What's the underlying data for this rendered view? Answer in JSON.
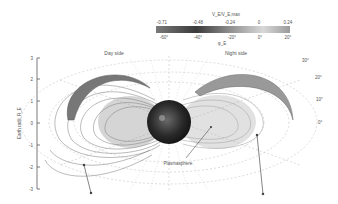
{
  "colorbar": {
    "top_title": "V_E/V_E,max",
    "top_ticks": [
      "-0.71",
      "-0.48",
      "-0.24",
      "0",
      "0.24"
    ],
    "bottom_ticks": [
      "-60°",
      "-40°",
      "-20°",
      "0°",
      "20°"
    ],
    "bottom_title": "φ_E",
    "gradient": [
      "#7a7a7a",
      "#3a3a3a",
      "#8e8e8e",
      "#d8d8d8",
      "#9a9a9a"
    ]
  },
  "labels": {
    "day_side": "Day side",
    "night_side": "Night side",
    "plasmasphere": "Plasmasphere"
  },
  "y_axis": {
    "title": "Earth radii, R_E",
    "ticks": [
      "3",
      "2",
      "1",
      "0",
      "-1",
      "-2",
      "-3"
    ]
  },
  "latitude_labels": [
    "30°",
    "20°",
    "10°",
    "0°"
  ]
}
